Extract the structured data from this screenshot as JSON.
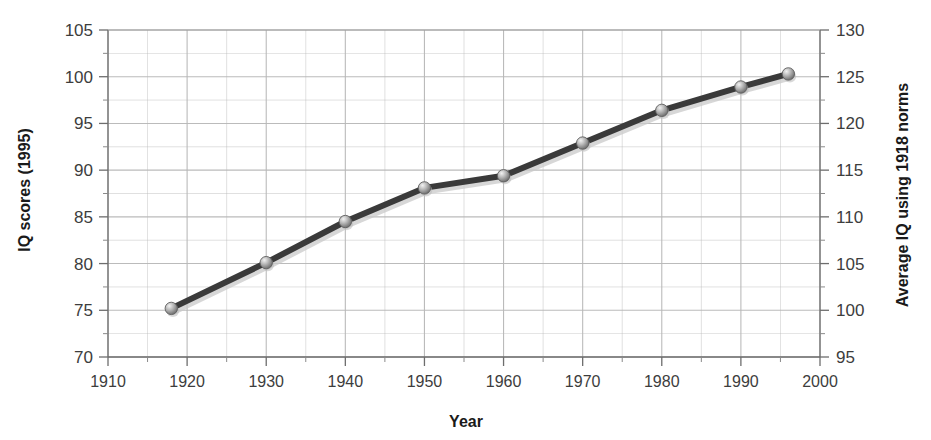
{
  "chart_data": {
    "type": "line",
    "title": "",
    "subtitle": "",
    "xlabel": "Year",
    "ylabel": "IQ scores (1995)",
    "y2label": "Average IQ using 1918 norms",
    "xlim": [
      1910,
      2000
    ],
    "ylim": [
      70,
      105
    ],
    "y2lim": [
      95,
      130
    ],
    "grid": true,
    "legend": "none",
    "x_major_ticks": [
      1910,
      1920,
      1930,
      1940,
      1950,
      1960,
      1970,
      1980,
      1990,
      2000
    ],
    "x_tick_labels": [
      "1910",
      "1920",
      "1930",
      "1940",
      "1950",
      "1960",
      "1970",
      "1980",
      "1990",
      "2000"
    ],
    "x_minor_step": 5,
    "y_major_ticks": [
      70,
      75,
      80,
      85,
      90,
      95,
      100,
      105
    ],
    "y_tick_labels": [
      "70",
      "75",
      "80",
      "85",
      "90",
      "95",
      "100",
      "105"
    ],
    "y_minor_step": 2.5,
    "y2_major_ticks": [
      95,
      100,
      105,
      110,
      115,
      120,
      125,
      130
    ],
    "y2_tick_labels": [
      "95",
      "100",
      "105",
      "110",
      "115",
      "120",
      "125",
      "130"
    ],
    "y2_minor_step": 2.5,
    "series": [
      {
        "name": "Average IQ",
        "x": [
          1918,
          1930,
          1940,
          1950,
          1960,
          1970,
          1980,
          1990,
          1996
        ],
        "values": [
          75.2,
          80.1,
          84.5,
          88.1,
          89.4,
          92.9,
          96.4,
          98.9,
          100.3
        ],
        "values_right_axis": [
          100.2,
          105.1,
          109.5,
          113.1,
          114.4,
          117.9,
          121.4,
          123.9,
          125.3
        ],
        "line_color": "#3a3a3a",
        "marker_color": "#9a9a9a",
        "marker": "sphere"
      }
    ],
    "colors": {
      "grid": "#b8b8b8",
      "axis": "#8f8f8f",
      "text": "#2b2b2b",
      "line": "#3a3a3a",
      "marker": "#a3a3a3",
      "background": "#ffffff"
    }
  }
}
